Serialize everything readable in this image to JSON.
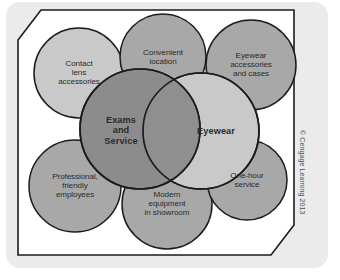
{
  "figure": {
    "kind": "venn-bubble-diagram",
    "background_color": "#ebebeb",
    "panel_color": "#ffffff",
    "border_color": "#1c1c1c",
    "core_circles": [
      {
        "id": "exams-and-service",
        "label": "Exams\nand\nService",
        "fill": "#8c8c8c",
        "cx": 123,
        "cy": 120,
        "r": 60
      },
      {
        "id": "eyewear",
        "label": "Eyewear",
        "fill": "#c9c9c9",
        "cx": 184,
        "cy": 122,
        "r": 58
      }
    ],
    "overlap": {
      "id": "overlap-lens",
      "fill": "#8f8f8f",
      "label": ""
    },
    "satellite_circles": [
      {
        "id": "contact-lens-accessories",
        "label": "Contact\nlens\naccessories",
        "fill": "#c9c9c9",
        "cx": 62,
        "cy": 64,
        "r": 45
      },
      {
        "id": "convenient-location",
        "label": "Convenient\nlocation",
        "fill": "#a8a8a8",
        "cx": 146,
        "cy": 48,
        "r": 43
      },
      {
        "id": "eyewear-accessories-and-cases",
        "label": "Eyewear\naccessories\nand cases",
        "fill": "#a8a8a8",
        "cx": 234,
        "cy": 56,
        "r": 45
      },
      {
        "id": "professional-friendly-employees",
        "label": "Professional,\nfriendly\nemployees",
        "fill": "#a8a8a8",
        "cx": 58,
        "cy": 177,
        "r": 46
      },
      {
        "id": "modern-equipment-in-showroom",
        "label": "Modern\nequipment\nin showroom",
        "fill": "#a8a8a8",
        "cx": 150,
        "cy": 195,
        "r": 45
      },
      {
        "id": "one-hour-service",
        "label": "One-hour\nservice",
        "fill": "#a8a8a8",
        "cx": 230,
        "cy": 171,
        "r": 40
      }
    ]
  },
  "credit": {
    "text": "© Cengage Learning 2013"
  }
}
